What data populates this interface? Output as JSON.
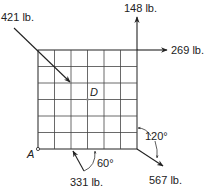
{
  "diagram": {
    "type": "force-diagram",
    "grid": {
      "rows": 6,
      "columns": 6,
      "color": "#333333"
    },
    "points": {
      "A": "A",
      "D": "D"
    },
    "forces": [
      {
        "id": "f421",
        "label": "421 lb.",
        "direction": "down-right diagonal into grid"
      },
      {
        "id": "f148",
        "label": "148 lb.",
        "direction": "up"
      },
      {
        "id": "f269",
        "label": "269 lb.",
        "direction": "right"
      },
      {
        "id": "f331",
        "label": "331 lb.",
        "direction": "up-left, 60° from bottom edge"
      },
      {
        "id": "f567",
        "label": "567 lb.",
        "direction": "down-right, 120° from right edge"
      }
    ],
    "angles": [
      {
        "id": "a60",
        "label": "60°"
      },
      {
        "id": "a120",
        "label": "120°"
      }
    ],
    "line_color": "#222222"
  }
}
